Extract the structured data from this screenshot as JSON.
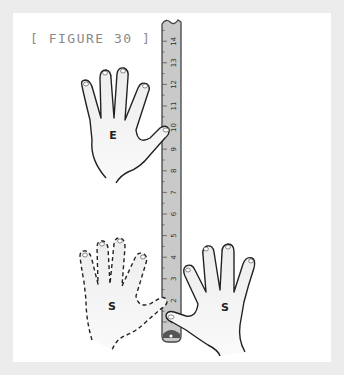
{
  "figure": {
    "title": "[ FIGURE 30 ]",
    "background_color": "#ececec",
    "panel_color": "#ffffff"
  },
  "ruler": {
    "color": "#c8c8c8",
    "outline_color": "#444444",
    "labels": [
      "1",
      "2",
      "3",
      "4",
      "5",
      "6",
      "7",
      "8",
      "9",
      "10",
      "11",
      "12",
      "13",
      "14"
    ]
  },
  "hands": [
    {
      "id": "upper",
      "label": "E",
      "style": "solid",
      "thumb_at_mark": "10"
    },
    {
      "id": "lower-left",
      "label": "S",
      "style": "dashed",
      "thumb_at_mark": "2"
    },
    {
      "id": "lower-right",
      "label": "S",
      "style": "solid",
      "thumb_at_mark": "2"
    }
  ]
}
